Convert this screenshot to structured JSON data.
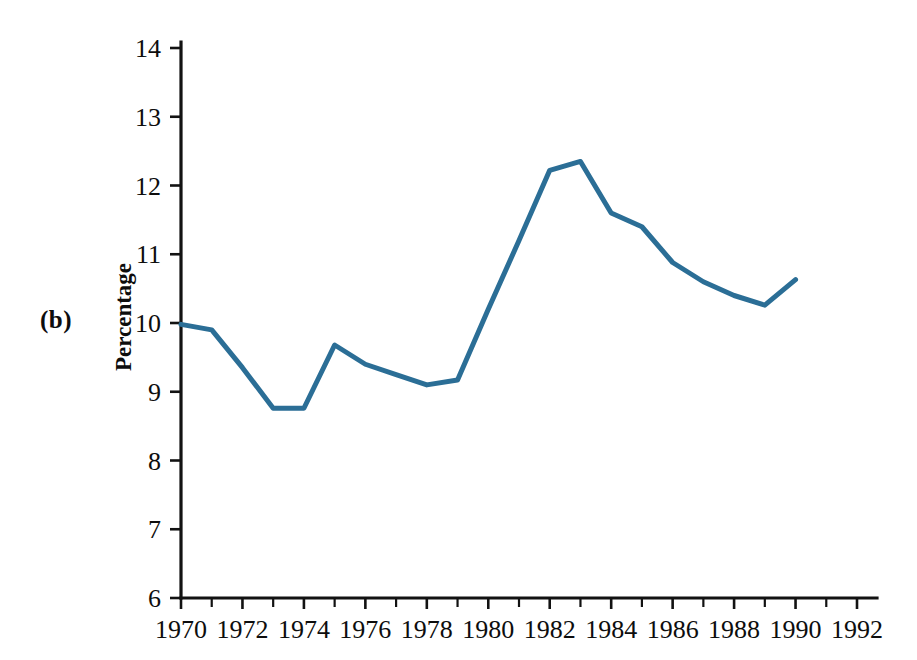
{
  "figure": {
    "panel_label": "(b)",
    "line_color": "#2b6e96",
    "axis_color": "#121212"
  },
  "chart_data": {
    "type": "line",
    "title": "",
    "xlabel": "",
    "ylabel": "Percentage",
    "xlim": [
      1970,
      1992
    ],
    "ylim": [
      6,
      14
    ],
    "grid": false,
    "legend": "none",
    "x_ticks": [
      1970,
      1972,
      1974,
      1976,
      1978,
      1980,
      1982,
      1984,
      1986,
      1988,
      1990,
      1992
    ],
    "x_tick_labels": [
      "1970",
      "1972",
      "1974",
      "1976",
      "1978",
      "1980",
      "1982",
      "1984",
      "1986",
      "1988",
      "1990",
      "1992"
    ],
    "x_minor_ticks": [
      1971,
      1973,
      1975,
      1977,
      1979,
      1981,
      1983,
      1985,
      1987,
      1989,
      1991
    ],
    "y_ticks": [
      6,
      7,
      8,
      9,
      10,
      11,
      12,
      13,
      14
    ],
    "y_tick_labels": [
      "6",
      "7",
      "8",
      "9",
      "10",
      "11",
      "12",
      "13",
      "14"
    ],
    "x": [
      1970,
      1971,
      1972,
      1973,
      1974,
      1975,
      1976,
      1977,
      1978,
      1979,
      1980,
      1981,
      1982,
      1983,
      1984,
      1985,
      1986,
      1987,
      1988,
      1989,
      1990
    ],
    "values": [
      9.98,
      9.9,
      9.35,
      8.76,
      8.76,
      9.68,
      9.4,
      9.25,
      9.1,
      9.17,
      10.2,
      11.2,
      12.22,
      12.35,
      11.6,
      11.4,
      10.88,
      10.6,
      10.4,
      10.26,
      10.63
    ],
    "series": [
      {
        "name": "Percentage",
        "color": "#2b6e96",
        "values": [
          9.98,
          9.9,
          9.35,
          8.76,
          8.76,
          9.68,
          9.4,
          9.25,
          9.1,
          9.17,
          10.2,
          11.2,
          12.22,
          12.35,
          11.6,
          11.4,
          10.88,
          10.6,
          10.4,
          10.26,
          10.63
        ]
      }
    ]
  }
}
